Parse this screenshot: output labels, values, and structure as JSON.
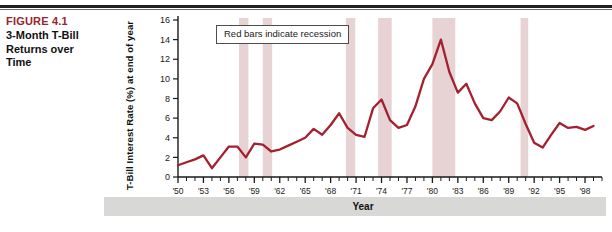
{
  "figure": {
    "number": "FIGURE 4.1",
    "title": "3-Month T-Bill Returns over Time",
    "title_line1": "3-Month T-Bill",
    "title_line2": "Returns over",
    "title_line3": "Time"
  },
  "legend": {
    "note": "Red bars indicate recession"
  },
  "axis": {
    "year_band_label": "Year"
  },
  "colors": {
    "line": "#a3202f",
    "recession_bar": "#e7d2d4",
    "figure_number": "#96272d",
    "year_band": "#d8d8d6",
    "axis": "#1a1a1a"
  },
  "chart_data": {
    "type": "line",
    "title": "3-Month T-Bill Returns over Time",
    "xlabel": "Year",
    "ylabel": "T-Bill Interest Rate (%) at end of year",
    "ylim": [
      0,
      16
    ],
    "yticks": [
      0,
      2,
      4,
      6,
      8,
      10,
      12,
      14,
      16
    ],
    "xlim": [
      1950,
      2000
    ],
    "xticks": [
      1950,
      1953,
      1956,
      1959,
      1962,
      1965,
      1968,
      1971,
      1974,
      1977,
      1980,
      1983,
      1986,
      1989,
      1992,
      1995,
      1998
    ],
    "xticklabels": [
      "'50",
      "'53",
      "'56",
      "'59",
      "'62",
      "'65",
      "'68",
      "'71",
      "'74",
      "'77",
      "'80",
      "'83",
      "'86",
      "'89",
      "'92",
      "'95",
      "'98"
    ],
    "grid": false,
    "legend_position": "inside-top-left",
    "annotations": [
      "Red bars indicate recession"
    ],
    "x": [
      1950,
      1951,
      1952,
      1953,
      1954,
      1955,
      1956,
      1957,
      1958,
      1959,
      1960,
      1961,
      1962,
      1963,
      1964,
      1965,
      1966,
      1967,
      1968,
      1969,
      1970,
      1971,
      1972,
      1973,
      1974,
      1975,
      1976,
      1977,
      1978,
      1979,
      1980,
      1981,
      1982,
      1983,
      1984,
      1985,
      1986,
      1987,
      1988,
      1989,
      1990,
      1991,
      1992,
      1993,
      1994,
      1995,
      1996,
      1997,
      1998,
      1999
    ],
    "values": [
      1.2,
      1.5,
      1.8,
      2.2,
      0.9,
      2.0,
      3.1,
      3.1,
      2.0,
      3.4,
      3.3,
      2.6,
      2.8,
      3.2,
      3.6,
      4.0,
      4.9,
      4.3,
      5.3,
      6.5,
      5.0,
      4.3,
      4.1,
      7.0,
      7.9,
      5.8,
      5.0,
      5.3,
      7.2,
      10.0,
      11.5,
      14.0,
      10.7,
      8.6,
      9.5,
      7.5,
      6.0,
      5.8,
      6.7,
      8.1,
      7.5,
      5.4,
      3.5,
      3.0,
      4.3,
      5.5,
      5.0,
      5.1,
      4.8,
      5.2
    ],
    "recessions": [
      {
        "start": 1957.2,
        "end": 1958.3,
        "label": "1957-58 recession"
      },
      {
        "start": 1960.0,
        "end": 1961.1,
        "label": "1960-61 recession"
      },
      {
        "start": 1969.8,
        "end": 1970.9,
        "label": "1969-70 recession"
      },
      {
        "start": 1973.6,
        "end": 1975.2,
        "label": "1973-75 recession"
      },
      {
        "start": 1980.0,
        "end": 1982.7,
        "label": "1980-82 recession"
      },
      {
        "start": 1990.4,
        "end": 1991.3,
        "label": "1990-91 recession"
      }
    ]
  }
}
